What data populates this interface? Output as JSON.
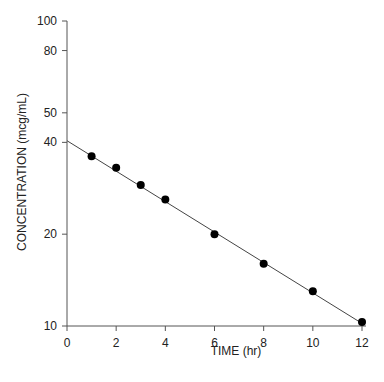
{
  "chart_data": {
    "type": "scatter",
    "title": "",
    "xlabel": "TIME (hr)",
    "ylabel": "CONCENTRATION (mcg/mL)",
    "xlim": [
      0,
      12
    ],
    "ylim": [
      10,
      100
    ],
    "yscale": "log",
    "grid": false,
    "x_ticks": [
      0,
      2,
      4,
      6,
      8,
      10,
      12
    ],
    "y_ticks": [
      10,
      20,
      40,
      50,
      80,
      100
    ],
    "series": [
      {
        "name": "observed",
        "marker": "filled-circle",
        "x": [
          1,
          2,
          3,
          4,
          6,
          8,
          10,
          12
        ],
        "y": [
          36,
          33,
          29,
          26,
          20,
          16,
          13,
          10.3
        ]
      },
      {
        "name": "fitted line",
        "style": "line",
        "x": [
          0,
          12
        ],
        "y": [
          40.5,
          10.2
        ]
      }
    ]
  }
}
